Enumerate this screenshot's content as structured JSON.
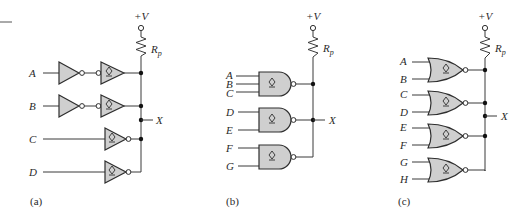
{
  "figure": {
    "header_rule": true,
    "panels": [
      {
        "id": "a",
        "caption": "(a)",
        "supply_label": "+V",
        "resistor_label": "R",
        "resistor_sub": "p",
        "output_label": "X",
        "gate_type": "open-collector buffer/inverter",
        "inputs": [
          "A",
          "B",
          "C",
          "D"
        ]
      },
      {
        "id": "b",
        "caption": "(b)",
        "supply_label": "+V",
        "resistor_label": "R",
        "resistor_sub": "p",
        "output_label": "X",
        "gate_type": "open-collector NAND",
        "inputs": [
          "A",
          "B",
          "C",
          "D",
          "E",
          "F",
          "G"
        ]
      },
      {
        "id": "c",
        "caption": "(c)",
        "supply_label": "+V",
        "resistor_label": "R",
        "resistor_sub": "p",
        "output_label": "X",
        "gate_type": "open-collector NOR",
        "inputs": [
          "A",
          "B",
          "C",
          "D",
          "E",
          "F",
          "G",
          "H"
        ]
      }
    ]
  },
  "colors": {
    "gate_fill": "#cfcfcf",
    "line": "#2e2e2e",
    "background": "#ffffff"
  }
}
